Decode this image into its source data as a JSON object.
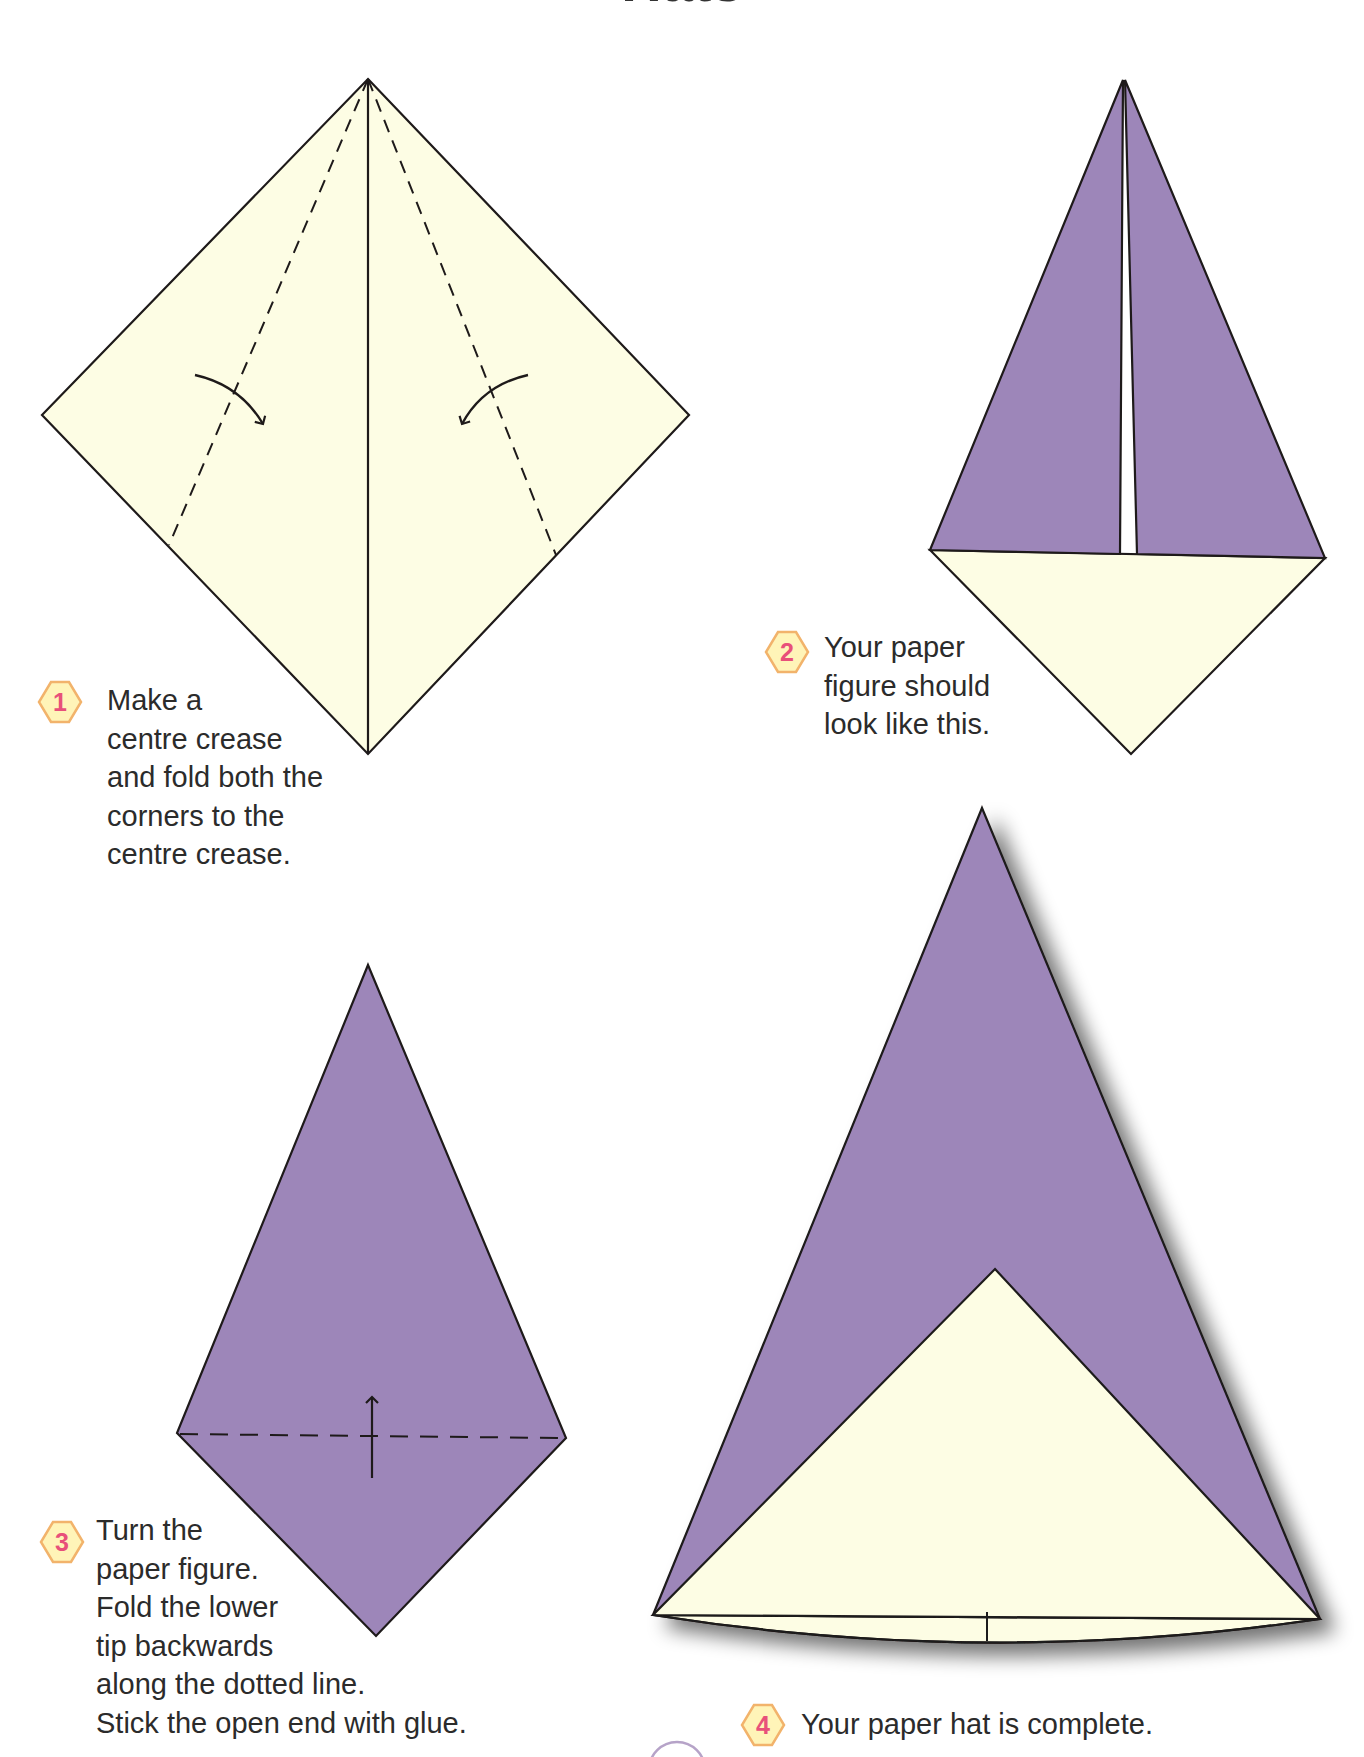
{
  "page": {
    "title": "Hats"
  },
  "colors": {
    "paper_front": "#9d86b9",
    "paper_back": "#fdfde4",
    "outline": "#1e1a1a",
    "badge_fill": "#fff4b8",
    "badge_border": "#f2b36b",
    "badge_number": "#e8507a",
    "text": "#2b2b2b"
  },
  "steps": [
    {
      "number": "1",
      "lines": [
        "Make a",
        "centre crease",
        "and fold both the",
        "corners to the",
        "centre crease."
      ]
    },
    {
      "number": "2",
      "lines": [
        "Your paper",
        "figure should",
        "look like this."
      ]
    },
    {
      "number": "3",
      "lines": [
        "Turn the",
        "paper figure.",
        "Fold the lower",
        "tip backwards",
        "along the dotted line.",
        "Stick the open end with glue."
      ]
    },
    {
      "number": "4",
      "lines": [
        "Your paper hat is complete."
      ]
    }
  ],
  "icons": {
    "fold_arrow": "curved-arrow",
    "flip_arrow": "up-arrow",
    "step_badge": "diamond-badge"
  }
}
